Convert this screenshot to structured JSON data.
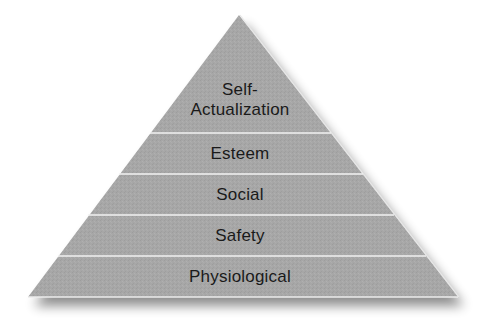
{
  "diagram": {
    "type": "pyramid",
    "colors": {
      "fill": "#a7a7a7",
      "divider": "#f2f2f2",
      "text": "#1a1a1a",
      "shadow": "#7a7a7a"
    },
    "levels": [
      {
        "label": "Self-\nActualization",
        "order": 1
      },
      {
        "label": "Esteem",
        "order": 2
      },
      {
        "label": "Social",
        "order": 3
      },
      {
        "label": "Safety",
        "order": 4
      },
      {
        "label": "Physiological",
        "order": 5
      }
    ]
  }
}
